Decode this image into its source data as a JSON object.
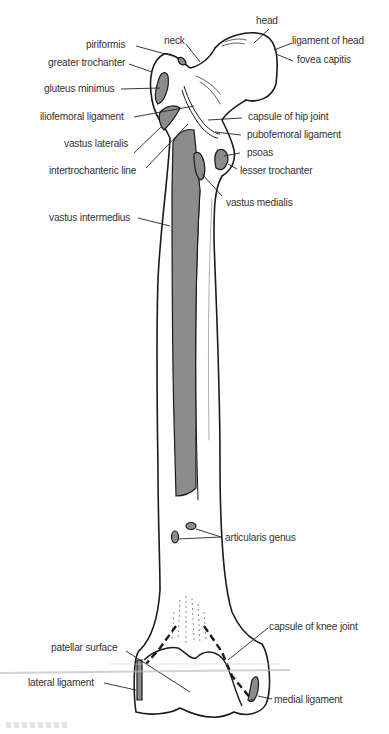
{
  "figure": {
    "colors": {
      "outline": "#1a1a1a",
      "attachment_fill": "#8c8c8c",
      "bone_fill": "#ffffff",
      "label_text": "#333333"
    }
  },
  "labels": {
    "head": "head",
    "ligament_of_head": "ligament of head",
    "fovea_capitis": "fovea capitis",
    "neck": "neck",
    "piriformis": "piriformis",
    "greater_trochanter": "greater trochanter",
    "gluteus_minimus": "gluteus minimus",
    "iliofemoral_ligament": "iliofemoral ligament",
    "capsule_of_hip_joint": "capsule of hip joint",
    "vastus_lateralis": "vastus lateralis",
    "pubofemoral_ligament": "pubofemoral ligament",
    "psoas": "psoas",
    "intertrochanteric_line": "intertrochanteric line",
    "lesser_trochanter": "lesser trochanter",
    "vastus_medialis": "vastus medialis",
    "vastus_intermedius": "vastus intermedius",
    "articularis_genus": "articularis genus",
    "capsule_of_knee_joint": "capsule of knee joint",
    "patellar_surface": "patellar surface",
    "lateral_ligament": "lateral ligament",
    "medial_ligament": "medial ligament"
  }
}
